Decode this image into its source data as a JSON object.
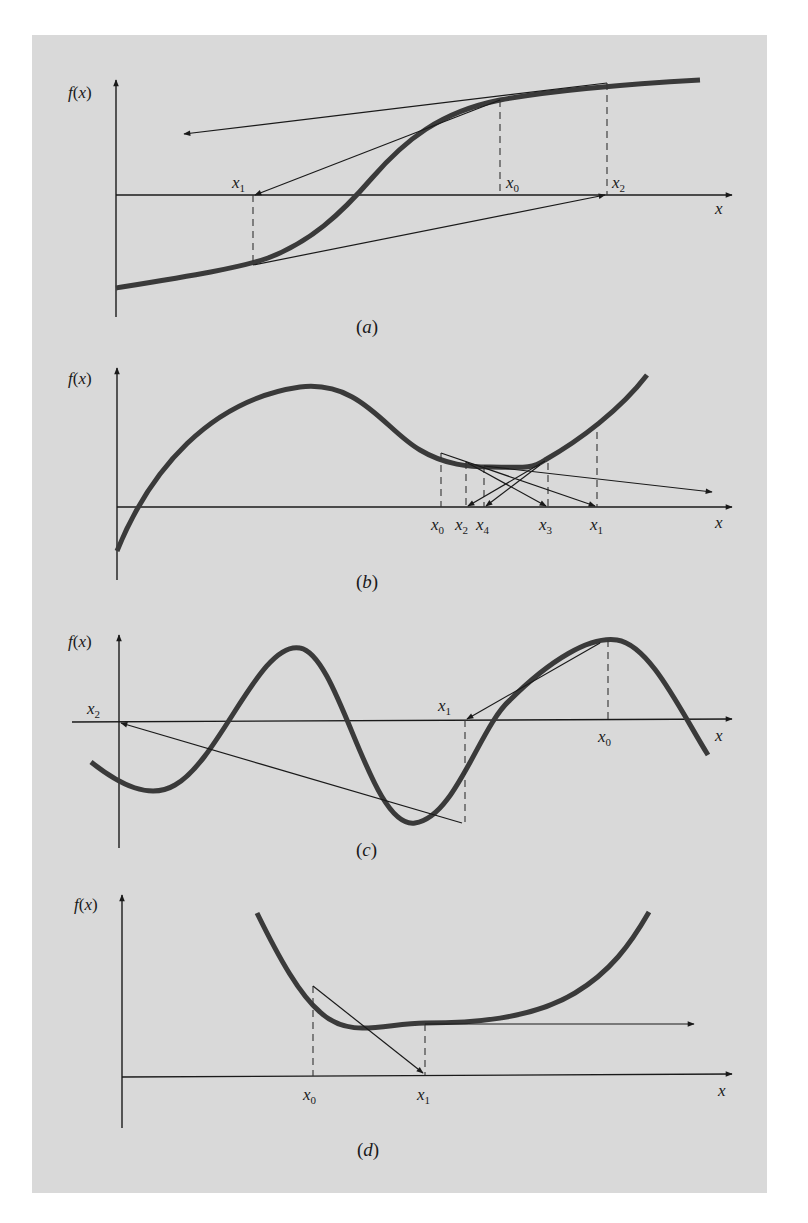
{
  "figure": {
    "background_color": "#d9d9d9",
    "curve_color": "#3a3a3a",
    "panels": [
      {
        "id": "a",
        "caption": "(a)",
        "y_axis_label": "f(x)",
        "x_axis_label": "x",
        "points": [
          {
            "name": "x",
            "sub": "1"
          },
          {
            "name": "x",
            "sub": "0"
          },
          {
            "name": "x",
            "sub": "2"
          }
        ]
      },
      {
        "id": "b",
        "caption": "(b)",
        "y_axis_label": "f(x)",
        "x_axis_label": "x",
        "points": [
          {
            "name": "x",
            "sub": "0"
          },
          {
            "name": "x",
            "sub": "2"
          },
          {
            "name": "x",
            "sub": "4"
          },
          {
            "name": "x",
            "sub": "3"
          },
          {
            "name": "x",
            "sub": "1"
          }
        ]
      },
      {
        "id": "c",
        "caption": "(c)",
        "y_axis_label": "f(x)",
        "x_axis_label": "x",
        "points": [
          {
            "name": "x",
            "sub": "2"
          },
          {
            "name": "x",
            "sub": "1"
          },
          {
            "name": "x",
            "sub": "0"
          }
        ]
      },
      {
        "id": "d",
        "caption": "(d)",
        "y_axis_label": "f(x)",
        "x_axis_label": "x",
        "points": [
          {
            "name": "x",
            "sub": "0"
          },
          {
            "name": "x",
            "sub": "1"
          }
        ]
      }
    ]
  }
}
